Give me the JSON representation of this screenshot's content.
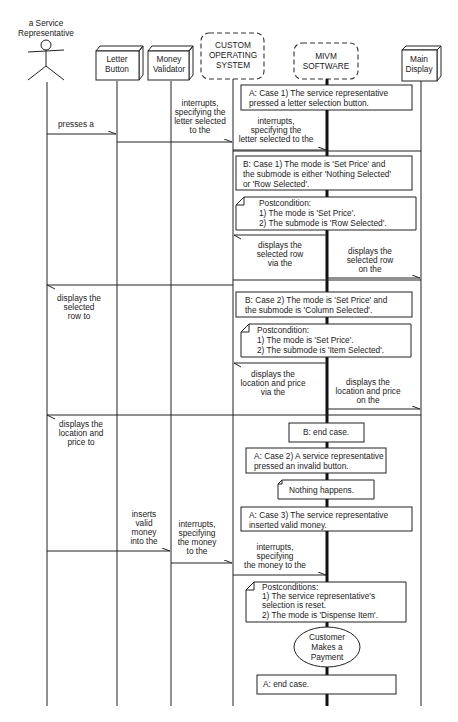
{
  "diagram": {
    "type": "sequence-diagram",
    "actor": {
      "label_line1": "a Service",
      "label_line2": "Representative"
    },
    "lifelines": [
      {
        "id": "letter_button",
        "line1": "Letter",
        "line2": "Button",
        "style": "device"
      },
      {
        "id": "money_validator",
        "line1": "Money",
        "line2": "Validator",
        "style": "device"
      },
      {
        "id": "custom_os",
        "line1": "CUSTOM",
        "line2": "OPERATING",
        "line3": "SYSTEM",
        "style": "dashed"
      },
      {
        "id": "mivm_software",
        "line1": "MIVM",
        "line2": "SOFTWARE",
        "style": "dashed"
      },
      {
        "id": "main_display",
        "line1": "Main",
        "line2": "Display",
        "style": "device"
      }
    ],
    "messages": [
      {
        "from": "actor",
        "to": "letter_button",
        "lines": [
          "presses a"
        ]
      },
      {
        "from": "letter_button",
        "to": "custom_os",
        "lines": [
          "interrupts,",
          "specifying the",
          "letter selected",
          "to the"
        ]
      },
      {
        "from": "custom_os",
        "to": "mivm_software",
        "lines": [
          "interrupts,",
          "specifying the",
          "letter selected to the"
        ]
      },
      {
        "from": "mivm_software",
        "to": "custom_os",
        "lines": [
          "displays the",
          "selected row",
          "via the"
        ]
      },
      {
        "from": "mivm_software",
        "to": "main_display",
        "lines": [
          "displays the",
          "selected row",
          "on the"
        ]
      },
      {
        "from": "custom_os",
        "to": "actor",
        "lines": [
          "displays the",
          "selected",
          "row to"
        ]
      },
      {
        "from": "mivm_software",
        "to": "custom_os",
        "lines": [
          "displays the",
          "location and price",
          "via the"
        ]
      },
      {
        "from": "mivm_software",
        "to": "main_display",
        "lines": [
          "displays the",
          "location and price",
          "on the"
        ]
      },
      {
        "from": "custom_os",
        "to": "actor",
        "lines": [
          "displays the",
          "location and",
          "price to"
        ]
      },
      {
        "from": "actor",
        "to": "money_validator",
        "lines": [
          "inserts",
          "valid",
          "money",
          "into the"
        ]
      },
      {
        "from": "money_validator",
        "to": "custom_os",
        "lines": [
          "interrupts,",
          "specifying",
          "the money",
          "to the"
        ]
      },
      {
        "from": "custom_os",
        "to": "mivm_software",
        "lines": [
          "interrupts,",
          "specifying",
          "the money to the"
        ]
      }
    ],
    "conditions": [
      {
        "id": "a_case1",
        "lines": [
          "A: Case 1) The service representative",
          "pressed a letter selection button."
        ]
      },
      {
        "id": "b_case1",
        "lines": [
          "B: Case 1) The mode is 'Set Price' and",
          "the submode is either 'Nothing Selected'",
          "or 'Row Selected'."
        ]
      },
      {
        "id": "b_case2",
        "lines": [
          "B: Case 2) The mode is 'Set Price' and",
          "the submode is 'Column Selected'."
        ]
      },
      {
        "id": "b_end",
        "lines": [
          "B: end case."
        ]
      },
      {
        "id": "a_case2",
        "lines": [
          "A: Case 2) A service representative",
          "pressed an invalid button."
        ]
      },
      {
        "id": "a_case3",
        "lines": [
          "A: Case 3) The service representative",
          "inserted valid money."
        ]
      },
      {
        "id": "a_end",
        "lines": [
          "A: end case."
        ]
      }
    ],
    "notes": [
      {
        "id": "post1",
        "lines": [
          "Postcondition:",
          "1) The mode is 'Set Price'.",
          "2) The submode is 'Row Selected'."
        ]
      },
      {
        "id": "post2",
        "lines": [
          "Postcondition:",
          "1) The mode is 'Set Price'.",
          "2) The submode is 'Item Selected'."
        ]
      },
      {
        "id": "nothing",
        "lines": [
          "Nothing happens."
        ]
      },
      {
        "id": "post3",
        "lines": [
          "Postconditions:",
          "1) The service representative's",
          "selection is reset.",
          "2) The mode is 'Dispense Item'."
        ]
      }
    ],
    "use_case": {
      "lines": [
        "Customer",
        "Makes a",
        "Payment"
      ]
    }
  }
}
